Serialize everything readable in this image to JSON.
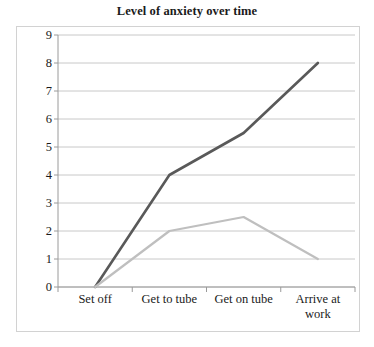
{
  "chart_data": {
    "type": "line",
    "title": "Level of anxiety over time",
    "xlabel": "",
    "ylabel": "",
    "categories": [
      "Set off",
      "Get to tube",
      "Get on tube",
      "Arrive at work"
    ],
    "category_label_lines": [
      [
        "Set off"
      ],
      [
        "Get to tube"
      ],
      [
        "Get on tube"
      ],
      [
        "Arrive at",
        "work"
      ]
    ],
    "ylim": [
      0,
      9
    ],
    "yticks": [
      0,
      1,
      2,
      3,
      4,
      5,
      6,
      7,
      8,
      9
    ],
    "ytick_labels": [
      "0",
      "1",
      "2",
      "3",
      "4",
      "5",
      "6",
      "7",
      "8",
      "9"
    ],
    "grid": true,
    "grid_axis": "y",
    "legend": "none",
    "series": [
      {
        "name": "series-1",
        "color": "#595959",
        "width": 2.6,
        "values": [
          0,
          4,
          5.5,
          8
        ]
      },
      {
        "name": "series-2",
        "color": "#bfbfbf",
        "width": 2.2,
        "values": [
          0,
          2,
          2.5,
          1
        ]
      }
    ]
  },
  "colors": {
    "title_text": "#1a1a1a",
    "axis_text": "#1a1a1a",
    "gridline": "#c8c8c8",
    "axis_line": "#9a9a9a",
    "frame_border": "#d2d2d2",
    "plot_background": "#ffffff",
    "series_dark": "#595959",
    "series_light": "#bfbfbf"
  }
}
